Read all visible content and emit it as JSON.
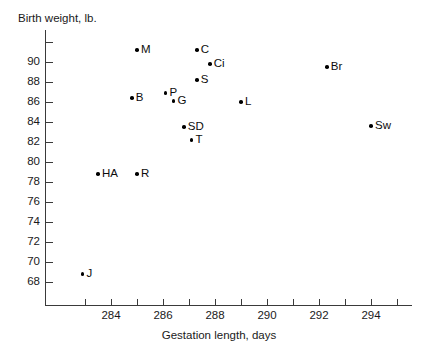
{
  "chart_data": {
    "type": "scatter",
    "title": "",
    "xlabel": "Gestation length, days",
    "ylabel": "Birth weight, lb.",
    "xlim": [
      282.7,
      295.2
    ],
    "ylim": [
      67.0,
      92.5
    ],
    "grid": false,
    "legend": "none",
    "x_ticks_major": [
      284,
      286,
      288,
      290,
      292,
      294
    ],
    "x_ticks_minor": [
      283,
      285,
      287,
      289,
      291,
      293,
      295
    ],
    "x_ticklabels": [
      "284",
      "286",
      "288",
      "290",
      "292",
      "294"
    ],
    "y_ticks": [
      68,
      70,
      72,
      74,
      76,
      78,
      80,
      82,
      84,
      86,
      88,
      90,
      92
    ],
    "y_ticklabels": [
      "68",
      "70",
      "72",
      "74",
      "76",
      "78",
      "80",
      "82",
      "84",
      "86",
      "88",
      "90",
      ""
    ],
    "point_color": "#000000",
    "axis_color": "#3a3a3a",
    "points": [
      {
        "label": "M",
        "x": 285.0,
        "y": 91.2,
        "label_pos": "right"
      },
      {
        "label": "C",
        "x": 287.3,
        "y": 91.2,
        "label_pos": "right"
      },
      {
        "label": "Ci",
        "x": 287.8,
        "y": 89.8,
        "label_pos": "right"
      },
      {
        "label": "S",
        "x": 287.3,
        "y": 88.2,
        "label_pos": "right"
      },
      {
        "label": "Br",
        "x": 292.3,
        "y": 89.5,
        "label_pos": "right"
      },
      {
        "label": "B",
        "x": 284.8,
        "y": 86.4,
        "label_pos": "right"
      },
      {
        "label": "P",
        "x": 286.1,
        "y": 86.9,
        "label_pos": "right"
      },
      {
        "label": "G",
        "x": 286.4,
        "y": 86.1,
        "label_pos": "right"
      },
      {
        "label": "L",
        "x": 289.0,
        "y": 86.0,
        "label_pos": "right"
      },
      {
        "label": "SD",
        "x": 286.8,
        "y": 83.5,
        "label_pos": "right"
      },
      {
        "label": "T",
        "x": 287.1,
        "y": 82.2,
        "label_pos": "right"
      },
      {
        "label": "Sw",
        "x": 294.0,
        "y": 83.6,
        "label_pos": "right"
      },
      {
        "label": "HA",
        "x": 283.5,
        "y": 78.8,
        "label_pos": "right"
      },
      {
        "label": "R",
        "x": 285.0,
        "y": 78.8,
        "label_pos": "right"
      },
      {
        "label": "J",
        "x": 282.9,
        "y": 68.8,
        "label_pos": "right"
      }
    ]
  }
}
